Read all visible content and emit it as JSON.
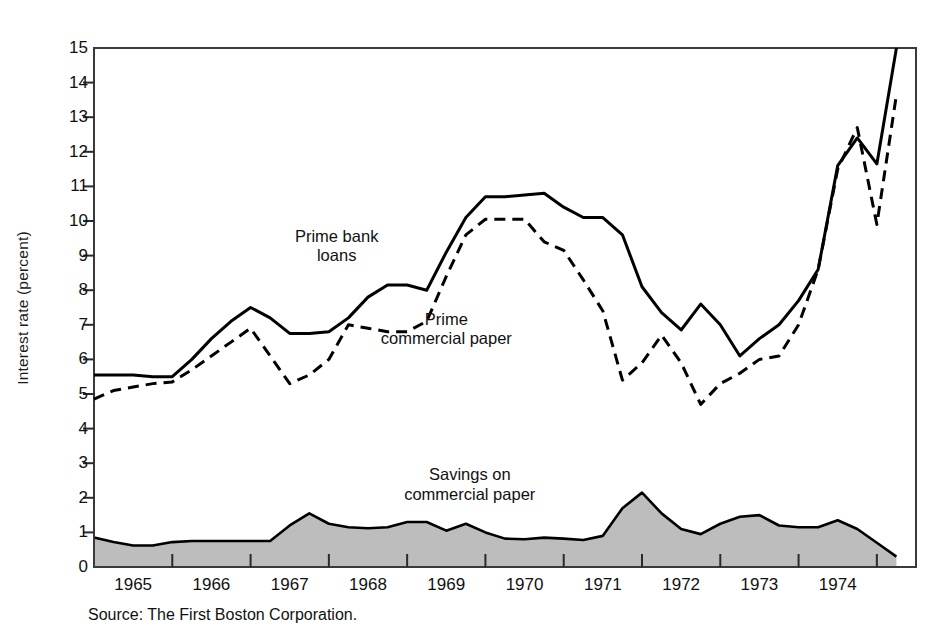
{
  "figure": {
    "source_note": "Source: The First Boston Corporation.",
    "background_color": "#ffffff",
    "frame_color": "#3a3a3a",
    "fill_color": "#bdbdbd"
  },
  "chart_data": {
    "type": "line",
    "title": "",
    "xlabel": "",
    "ylabel": "Interest rate (percent)",
    "xlim": [
      1964.5,
      1975.0
    ],
    "ylim": [
      0,
      15
    ],
    "yticks": [
      0,
      1,
      2,
      3,
      4,
      5,
      6,
      7,
      8,
      9,
      10,
      11,
      12,
      13,
      14,
      15
    ],
    "ytick_labels": [
      "0",
      "1",
      "2",
      "3",
      "4",
      "5",
      "6",
      "7",
      "8",
      "9",
      "10",
      "11",
      "12",
      "13",
      "14",
      "15"
    ],
    "xticks": [
      1965,
      1966,
      1967,
      1968,
      1969,
      1970,
      1971,
      1972,
      1973,
      1974
    ],
    "xtick_labels": [
      "1965",
      "1966",
      "1967",
      "1968",
      "1969",
      "1970",
      "1971",
      "1972",
      "1973",
      "1974"
    ],
    "xtick_label_positions": [
      1965.0,
      1966.0,
      1967.0,
      1968.0,
      1969.0,
      1970.0,
      1971.0,
      1972.0,
      1973.0,
      1974.0
    ],
    "xtick_mark_positions": [
      1965.5,
      1966.5,
      1967.5,
      1968.5,
      1969.5,
      1970.5,
      1971.5,
      1972.5,
      1973.5,
      1974.5
    ],
    "grid": false,
    "legend": "inline-annotations",
    "x": [
      1964.5,
      1964.75,
      1965.0,
      1965.25,
      1965.5,
      1965.75,
      1966.0,
      1966.25,
      1966.5,
      1966.75,
      1967.0,
      1967.25,
      1967.5,
      1967.75,
      1968.0,
      1968.25,
      1968.5,
      1968.75,
      1969.0,
      1969.25,
      1969.5,
      1969.75,
      1970.0,
      1970.25,
      1970.5,
      1970.75,
      1971.0,
      1971.25,
      1971.5,
      1971.75,
      1972.0,
      1972.25,
      1972.5,
      1972.75,
      1973.0,
      1973.25,
      1973.5,
      1973.75,
      1974.0,
      1974.25,
      1974.5,
      1974.75
    ],
    "series": [
      {
        "name": "Prime bank loans",
        "style": "solid",
        "color": "#000000",
        "label_text": "Prime bank\nloans",
        "values": [
          5.55,
          5.55,
          5.55,
          5.5,
          5.5,
          6.0,
          6.6,
          7.1,
          7.5,
          7.2,
          6.75,
          6.75,
          6.8,
          7.2,
          7.8,
          8.15,
          8.15,
          8.0,
          9.1,
          10.1,
          10.7,
          10.7,
          10.75,
          10.8,
          10.4,
          10.1,
          10.1,
          9.6,
          8.1,
          7.35,
          6.85,
          7.6,
          7.0,
          6.1,
          6.6,
          7.0,
          7.7,
          8.6,
          11.6,
          12.4,
          11.65,
          15.0
        ]
      },
      {
        "name": "Prime commercial paper",
        "style": "dashed",
        "color": "#000000",
        "label_text": "Prime\ncommercial paper",
        "values": [
          4.85,
          5.1,
          5.2,
          5.3,
          5.35,
          5.7,
          6.1,
          6.5,
          6.9,
          6.1,
          5.3,
          5.55,
          6.0,
          7.0,
          6.9,
          6.8,
          6.8,
          7.1,
          8.4,
          9.6,
          10.05,
          10.05,
          10.05,
          9.4,
          9.15,
          8.3,
          7.4,
          5.4,
          5.9,
          6.7,
          5.9,
          4.7,
          5.3,
          5.6,
          6.0,
          6.1,
          7.0,
          8.6,
          11.5,
          12.7,
          9.9,
          13.65
        ]
      }
    ],
    "area_series": {
      "name": "Savings on commercial paper",
      "style": "filled",
      "fill": "#bdbdbd",
      "edge_color": "#000000",
      "label_text": "Savings on\ncommercial paper",
      "values": [
        0.85,
        0.72,
        0.62,
        0.62,
        0.72,
        0.75,
        0.75,
        0.75,
        0.75,
        0.75,
        1.2,
        1.55,
        1.25,
        1.15,
        1.12,
        1.15,
        1.3,
        1.3,
        1.05,
        1.25,
        1.0,
        0.82,
        0.8,
        0.85,
        0.82,
        0.78,
        0.9,
        1.7,
        2.15,
        1.55,
        1.1,
        0.95,
        1.25,
        1.45,
        1.5,
        1.2,
        1.15,
        1.15,
        1.35,
        1.1,
        0.7,
        0.3
      ]
    },
    "annotations": [
      {
        "text": "Prime bank\nloans",
        "x": 1967.6,
        "y": 9.55
      },
      {
        "text": "Prime\ncommercial paper",
        "x": 1969.0,
        "y": 7.15
      },
      {
        "text": "Savings on\ncommercial paper",
        "x": 1969.3,
        "y": 2.65
      }
    ]
  }
}
